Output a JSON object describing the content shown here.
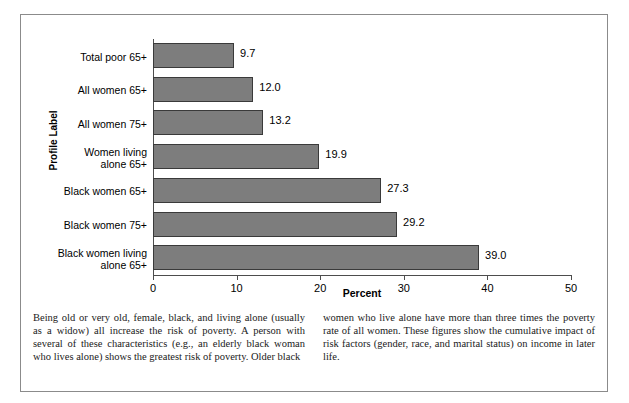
{
  "chart_data": {
    "type": "bar",
    "orientation": "horizontal",
    "title": "",
    "xlabel": "Percent",
    "ylabel": "Profile Label",
    "xlim": [
      0,
      50
    ],
    "xticks": [
      0,
      10,
      20,
      30,
      40,
      50
    ],
    "grid": false,
    "legend": null,
    "bar_color": "#7d7d7d",
    "bar_border_color": "#3a3a3a",
    "categories": [
      "Total poor 65+",
      "All women 65+",
      "All women 75+",
      "Women living alone 65+",
      "Black women 65+",
      "Black women 75+",
      "Black women living alone 65+"
    ],
    "category_lines": [
      [
        "Total poor 65+"
      ],
      [
        "All women 65+"
      ],
      [
        "All women 75+"
      ],
      [
        "Women living",
        "alone 65+"
      ],
      [
        "Black women 65+"
      ],
      [
        "Black women 75+"
      ],
      [
        "Black women living",
        "alone 65+"
      ]
    ],
    "values": [
      9.7,
      12.0,
      13.2,
      19.9,
      27.3,
      29.2,
      39.0
    ],
    "value_labels": [
      "9.7",
      "12.0",
      "13.2",
      "19.9",
      "27.3",
      "29.2",
      "39.0"
    ]
  },
  "caption": {
    "left": "Being old or very old, female, black, and living alone (usually as a widow) all increase the risk of poverty. A person with several of these characteristics (e.g., an elderly black woman who lives alone) shows the greatest risk of poverty. Older black",
    "right": "women who live alone have more than three times the poverty rate of all women. These figures show the cumulative impact of risk factors (gender, race, and marital status) on income in later life."
  }
}
